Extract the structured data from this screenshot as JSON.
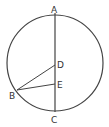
{
  "diagram": {
    "points": [
      {
        "id": "A",
        "label": "A"
      },
      {
        "id": "B",
        "label": "B"
      },
      {
        "id": "C",
        "label": "C"
      },
      {
        "id": "D",
        "label": "D"
      },
      {
        "id": "E",
        "label": "E"
      }
    ],
    "segments": [
      [
        "A",
        "C"
      ],
      [
        "B",
        "D"
      ],
      [
        "B",
        "E"
      ]
    ],
    "shapes": [
      "circle"
    ],
    "stroke_color": "#444444"
  }
}
